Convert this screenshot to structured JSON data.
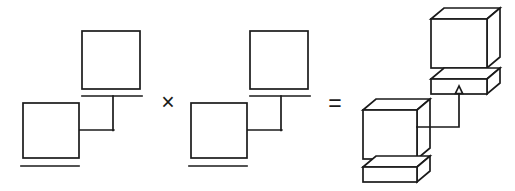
{
  "figure": {
    "background_color": "#ffffff",
    "stroke_color": "#1a1a1a",
    "operators": {
      "times": {
        "symbol": "×",
        "name": "multiplication-sign",
        "x": 166,
        "y": 104
      },
      "equals": {
        "symbol": "=",
        "name": "equals-sign",
        "x": 333,
        "y": 105
      }
    },
    "operands": [
      {
        "id": "operand-left",
        "kind": "flat-2d-group",
        "shapes": [
          {
            "name": "upper-square",
            "type": "square",
            "x": 82,
            "y": 31,
            "w": 58,
            "h": 58
          },
          {
            "name": "lower-square",
            "type": "square",
            "x": 23,
            "y": 103,
            "w": 56,
            "h": 55
          },
          {
            "name": "upper-underline",
            "type": "line",
            "x1": 82,
            "y1": 96,
            "x2": 142,
            "y2": 96
          },
          {
            "name": "lower-underline",
            "type": "line",
            "x1": 21,
            "y1": 166,
            "x2": 79,
            "y2": 166
          },
          {
            "name": "connector-vertical",
            "type": "line",
            "x1": 113,
            "y1": 96,
            "x2": 113,
            "y2": 130
          },
          {
            "name": "connector-horizontal",
            "type": "line",
            "x1": 79,
            "y1": 130,
            "x2": 113,
            "y2": 130
          }
        ]
      },
      {
        "id": "operand-right",
        "kind": "flat-2d-group",
        "shapes": [
          {
            "name": "upper-square",
            "type": "square",
            "x": 250,
            "y": 31,
            "w": 58,
            "h": 58
          },
          {
            "name": "lower-square",
            "type": "square",
            "x": 191,
            "y": 103,
            "w": 56,
            "h": 55
          },
          {
            "name": "upper-underline",
            "type": "line",
            "x1": 250,
            "y1": 96,
            "x2": 310,
            "y2": 96
          },
          {
            "name": "lower-underline",
            "type": "line",
            "x1": 189,
            "y1": 166,
            "x2": 247,
            "y2": 166
          },
          {
            "name": "connector-vertical",
            "type": "line",
            "x1": 281,
            "y1": 96,
            "x2": 281,
            "y2": 130
          },
          {
            "name": "connector-horizontal",
            "type": "line",
            "x1": 247,
            "y1": 130,
            "x2": 281,
            "y2": 130
          }
        ]
      }
    ],
    "result": {
      "id": "result-3d-group",
      "kind": "isometric-3d-group",
      "depth_dx": 13,
      "depth_dy": -11,
      "shapes": [
        {
          "name": "upper-cube",
          "type": "cube",
          "x": 431,
          "y": 19,
          "w": 56,
          "h": 49
        },
        {
          "name": "upper-slab",
          "type": "slab",
          "x": 431,
          "y": 79,
          "w": 56,
          "h": 15
        },
        {
          "name": "lower-cube",
          "type": "cube",
          "x": 363,
          "y": 110,
          "w": 54,
          "h": 49
        },
        {
          "name": "lower-slab",
          "type": "slab",
          "x": 363,
          "y": 167,
          "w": 54,
          "h": 15
        },
        {
          "name": "arrow-connector",
          "type": "elbow-arrow",
          "from_x": 418,
          "from_y": 128,
          "corner_x": 459,
          "to_y": 90
        },
        {
          "name": "arrow-head",
          "type": "arrowhead",
          "x": 459,
          "y": 90,
          "direction": "up"
        }
      ]
    }
  }
}
